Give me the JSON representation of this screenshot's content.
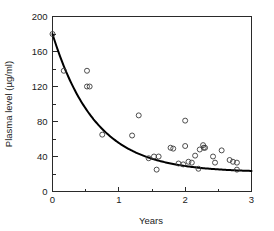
{
  "chart_data": {
    "type": "scatter",
    "title": "",
    "xlabel": "Years",
    "ylabel": "Plasma level (µg/ml)",
    "xlim": [
      0,
      3
    ],
    "ylim": [
      0,
      200
    ],
    "grid": false,
    "legend": "none",
    "x_ticks": [
      0,
      1,
      2,
      3
    ],
    "x_tick_labels": [
      "0",
      "1",
      "2",
      "3"
    ],
    "x_minor_ticks": [
      0.5,
      1.5,
      2.5
    ],
    "y_ticks": [
      0,
      40,
      80,
      120,
      160,
      200
    ],
    "y_tick_labels": [
      "0",
      "40",
      "80",
      "120",
      "160",
      "200"
    ],
    "y_minor_ticks": [
      20,
      60,
      100,
      140,
      180
    ],
    "series": [
      {
        "name": "Observed plasma level",
        "marker": "open-circle",
        "x": [
          0.0,
          0.17,
          0.52,
          0.52,
          0.56,
          0.75,
          1.2,
          1.3,
          1.45,
          1.53,
          1.57,
          1.6,
          1.78,
          1.82,
          1.9,
          1.97,
          2.0,
          2.0,
          2.05,
          2.1,
          2.15,
          2.2,
          2.22,
          2.27,
          2.28,
          2.3,
          2.42,
          2.45,
          2.55,
          2.67,
          2.72,
          2.78,
          2.78
        ],
        "y": [
          180,
          138,
          138,
          120,
          120,
          65,
          64,
          87,
          38,
          40,
          25,
          40,
          50,
          49,
          32,
          31,
          81,
          52,
          34,
          33,
          41,
          26,
          48,
          53,
          50,
          50,
          40,
          33,
          47,
          36,
          34,
          33,
          25
        ]
      },
      {
        "name": "Fitted exponential decay",
        "type": "line",
        "equation": "y = 22 + 158 * exp(-1.55 * t)",
        "x": [
          0.0,
          0.25,
          0.5,
          0.75,
          1.0,
          1.25,
          1.5,
          1.75,
          2.0,
          2.25,
          2.5,
          2.75,
          3.0
        ],
        "y": [
          180,
          129,
          95,
          72,
          56,
          45,
          38,
          32,
          29,
          27,
          25,
          24,
          24
        ]
      }
    ]
  },
  "axes": {
    "x_title": "Years",
    "y_title": "Plasma level (µg/ml)"
  },
  "colors": {
    "marker_stroke": "#3a3a3a",
    "curve": "#000000",
    "frame": "#2a2a2a",
    "background": "#ffffff"
  }
}
